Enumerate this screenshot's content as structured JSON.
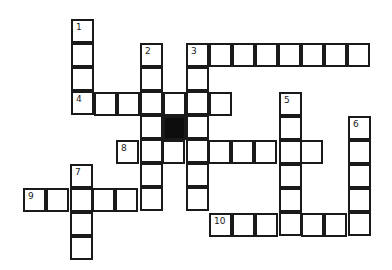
{
  "puzzle": {
    "type": "crossword",
    "cell_size": 23,
    "black_cells": [
      {
        "x": 164,
        "y": 117
      }
    ],
    "entries": [
      {
        "number": "1",
        "direction": "down",
        "x": 72,
        "y": 20,
        "length": 4
      },
      {
        "number": "2",
        "direction": "down",
        "x": 141,
        "y": 44,
        "length": 7
      },
      {
        "number": "3",
        "direction": "across",
        "x": 187,
        "y": 44,
        "length": 8
      },
      {
        "number": "3",
        "direction": "down",
        "x": 187,
        "y": 44,
        "length": 7
      },
      {
        "number": "4",
        "direction": "across",
        "x": 72,
        "y": 93,
        "length": 7
      },
      {
        "number": "5",
        "direction": "down",
        "x": 280,
        "y": 93,
        "length": 6
      },
      {
        "number": "6",
        "direction": "down",
        "x": 349,
        "y": 117,
        "length": 5
      },
      {
        "number": "7",
        "direction": "down",
        "x": 71,
        "y": 165,
        "length": 4
      },
      {
        "number": "8",
        "direction": "across",
        "x": 117,
        "y": 141,
        "length": 9
      },
      {
        "number": "9",
        "direction": "across",
        "x": 24,
        "y": 189,
        "length": 6
      },
      {
        "number": "10",
        "direction": "across",
        "x": 210,
        "y": 214,
        "length": 7
      }
    ]
  }
}
